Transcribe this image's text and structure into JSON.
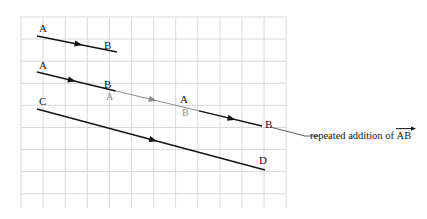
{
  "figure": {
    "title_hidden": "",
    "grid": {
      "x0": 21,
      "y0": 17,
      "x1": 286,
      "y1": 208,
      "cell": 22.1,
      "color": "#d5d5d5",
      "visible": true
    },
    "colors": {
      "black": "#141414",
      "gray": "#8c8c8c",
      "grid": "#d5d5d5",
      "leader": "#4a4a4a"
    },
    "vectors": [
      {
        "name": "ab-single",
        "from_label": "A",
        "to_label": "B",
        "x1": 37,
        "y1": 36,
        "x2": 117,
        "y2": 52,
        "color": "#141414",
        "arrow_t": 0.52
      },
      {
        "name": "ab-repeated",
        "from_label": "A",
        "to_label": "B",
        "x1": 37,
        "y1": 72,
        "x2": 262,
        "y2": 126,
        "color": "#141414",
        "segments": [
          {
            "t0": 0.0,
            "t1": 0.35,
            "color": "#141414"
          },
          {
            "t0": 0.35,
            "t1": 0.72,
            "color": "#8c8c8c"
          },
          {
            "t0": 0.72,
            "t1": 1.0,
            "color": "#141414"
          }
        ],
        "arrow_ts": [
          0.155,
          0.515,
          0.865
        ],
        "arrow_colors": [
          "#141414",
          "#8c8c8c",
          "#141414"
        ]
      },
      {
        "name": "cd",
        "from_label": "C",
        "to_label": "D",
        "x1": 37,
        "y1": 109,
        "x2": 265,
        "y2": 170,
        "color": "#141414",
        "arrow_t": 0.51
      }
    ],
    "labels": [
      {
        "name": "label-a-top",
        "text": "A",
        "x": 39,
        "y": 23,
        "color": "black"
      },
      {
        "name": "label-b-top",
        "text": "B",
        "x": 104,
        "y": 40,
        "color": "black"
      },
      {
        "name": "label-a-mid-start",
        "text": "A",
        "x": 39,
        "y": 60,
        "color": "black"
      },
      {
        "name": "label-b-mid-1",
        "text": "B",
        "x": 104,
        "y": 79,
        "color": "black"
      },
      {
        "name": "label-a-mid-2",
        "text": "A",
        "x": 106,
        "y": 92,
        "color": "gray"
      },
      {
        "name": "label-a-mid-3",
        "text": "A",
        "x": 180,
        "y": 94,
        "color": "black"
      },
      {
        "name": "label-b-mid-4",
        "text": "B",
        "x": 182,
        "y": 108,
        "color": "gray"
      },
      {
        "name": "label-b-mid-end",
        "text": "B",
        "x": 265,
        "y": 119,
        "color": "black"
      },
      {
        "name": "label-c",
        "text": "C",
        "x": 39,
        "y": 96,
        "color": "black"
      },
      {
        "name": "label-d",
        "text": "D",
        "x": 259,
        "y": 155,
        "color": "black"
      }
    ],
    "annotation": {
      "name": "repeated-addition-note",
      "prefix_text": "repeated addition of ",
      "vector_text": "AB",
      "leader": {
        "x1": 270,
        "y1": 127,
        "x2": 305,
        "y2": 136
      },
      "text_x": 310,
      "text_y": 130
    }
  }
}
